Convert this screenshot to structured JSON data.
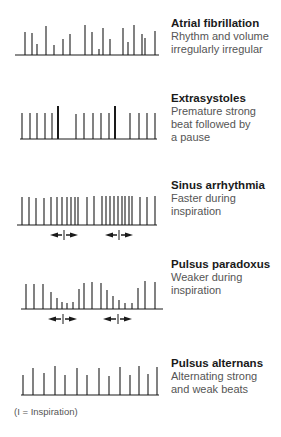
{
  "panels": [
    {
      "id": "atrial-fibrillation",
      "title": "Atrial fibrillation",
      "description": [
        "Rhythm and volume",
        "irregularly irregular"
      ],
      "baseline_y": 55,
      "trace_x": [
        15,
        159
      ],
      "beats": [
        {
          "x": 25,
          "top": 32
        },
        {
          "x": 32,
          "top": 33
        },
        {
          "x": 37,
          "top": 44
        },
        {
          "x": 46,
          "top": 26
        },
        {
          "x": 54,
          "top": 45
        },
        {
          "x": 63,
          "top": 39
        },
        {
          "x": 70,
          "top": 34
        },
        {
          "x": 85,
          "top": 25
        },
        {
          "x": 92,
          "top": 32
        },
        {
          "x": 99,
          "top": 49
        },
        {
          "x": 103,
          "top": 28
        },
        {
          "x": 110,
          "top": 39
        },
        {
          "x": 123,
          "top": 28
        },
        {
          "x": 128,
          "top": 42
        },
        {
          "x": 134,
          "top": 25
        },
        {
          "x": 142,
          "top": 34
        },
        {
          "x": 145,
          "top": 38
        },
        {
          "x": 155,
          "top": 31
        }
      ],
      "inspiration_markers": []
    },
    {
      "id": "extrasystoles",
      "title": "Extrasystoles",
      "description": [
        "Premature strong",
        "beat followed by",
        "a pause"
      ],
      "baseline_y": 139,
      "trace_x": [
        20,
        157
      ],
      "beats": [
        {
          "x": 22,
          "top": 113
        },
        {
          "x": 30,
          "top": 113
        },
        {
          "x": 37,
          "top": 113
        },
        {
          "x": 45,
          "top": 113
        },
        {
          "x": 52,
          "top": 113
        },
        {
          "x": 58,
          "top": 106,
          "strong": true
        },
        {
          "x": 76,
          "top": 114
        },
        {
          "x": 84,
          "top": 113
        },
        {
          "x": 93,
          "top": 113
        },
        {
          "x": 101,
          "top": 113
        },
        {
          "x": 109,
          "top": 113
        },
        {
          "x": 115,
          "top": 106,
          "strong": true
        },
        {
          "x": 130,
          "top": 113
        },
        {
          "x": 139,
          "top": 113
        },
        {
          "x": 147,
          "top": 113
        },
        {
          "x": 155,
          "top": 113
        }
      ],
      "inspiration_markers": []
    },
    {
      "id": "sinus-arrhythmia",
      "title": "Sinus arrhythmia",
      "description": [
        "Faster during",
        "inspiration"
      ],
      "baseline_y": 225,
      "trace_x": [
        17,
        157
      ],
      "beats": [
        {
          "x": 22,
          "top": 197
        },
        {
          "x": 29,
          "top": 197
        },
        {
          "x": 36,
          "top": 198
        },
        {
          "x": 44,
          "top": 198
        },
        {
          "x": 51,
          "top": 197
        },
        {
          "x": 57,
          "top": 197
        },
        {
          "x": 62,
          "top": 197
        },
        {
          "x": 67,
          "top": 197
        },
        {
          "x": 71,
          "top": 197
        },
        {
          "x": 75,
          "top": 197
        },
        {
          "x": 78,
          "top": 197
        },
        {
          "x": 87,
          "top": 197
        },
        {
          "x": 94,
          "top": 196
        },
        {
          "x": 102,
          "top": 196
        },
        {
          "x": 106,
          "top": 196
        },
        {
          "x": 110,
          "top": 196
        },
        {
          "x": 114,
          "top": 196
        },
        {
          "x": 118,
          "top": 196
        },
        {
          "x": 122,
          "top": 196
        },
        {
          "x": 125,
          "top": 196
        },
        {
          "x": 129,
          "top": 196
        },
        {
          "x": 132,
          "top": 196
        },
        {
          "x": 140,
          "top": 197
        },
        {
          "x": 147,
          "top": 197
        },
        {
          "x": 155,
          "top": 196
        }
      ],
      "inspiration_markers": [
        {
          "y": 235,
          "left": 50,
          "center": 64,
          "right": 78
        },
        {
          "y": 235,
          "left": 105,
          "center": 119,
          "right": 133
        }
      ]
    },
    {
      "id": "pulsus-paradoxus",
      "title": "Pulsus paradoxus",
      "description": [
        "Weaker during",
        "inspiration"
      ],
      "baseline_y": 309,
      "trace_x": [
        21,
        163
      ],
      "beats": [
        {
          "x": 26,
          "top": 284
        },
        {
          "x": 34,
          "top": 284
        },
        {
          "x": 43,
          "top": 284
        },
        {
          "x": 51,
          "top": 292
        },
        {
          "x": 57,
          "top": 298
        },
        {
          "x": 62,
          "top": 302
        },
        {
          "x": 67,
          "top": 303
        },
        {
          "x": 73,
          "top": 302
        },
        {
          "x": 79,
          "top": 289
        },
        {
          "x": 84,
          "top": 283
        },
        {
          "x": 92,
          "top": 282
        },
        {
          "x": 101,
          "top": 283
        },
        {
          "x": 107,
          "top": 290
        },
        {
          "x": 113,
          "top": 296
        },
        {
          "x": 119,
          "top": 300
        },
        {
          "x": 125,
          "top": 303
        },
        {
          "x": 132,
          "top": 303
        },
        {
          "x": 138,
          "top": 288
        },
        {
          "x": 145,
          "top": 281
        },
        {
          "x": 155,
          "top": 282
        }
      ],
      "inspiration_markers": [
        {
          "y": 319,
          "left": 48,
          "center": 63,
          "right": 77
        },
        {
          "y": 319,
          "left": 103,
          "center": 118,
          "right": 132
        }
      ]
    },
    {
      "id": "pulsus-alternans",
      "title": "Pulsus alternans",
      "description": [
        "Alternating strong",
        "and weak beats"
      ],
      "baseline_y": 395,
      "trace_x": [
        21,
        159
      ],
      "beats": [
        {
          "x": 23,
          "top": 375
        },
        {
          "x": 33,
          "top": 368
        },
        {
          "x": 44,
          "top": 373
        },
        {
          "x": 55,
          "top": 366
        },
        {
          "x": 65,
          "top": 375
        },
        {
          "x": 77,
          "top": 368
        },
        {
          "x": 87,
          "top": 375
        },
        {
          "x": 99,
          "top": 368
        },
        {
          "x": 109,
          "top": 376
        },
        {
          "x": 120,
          "top": 367
        },
        {
          "x": 130,
          "top": 375
        },
        {
          "x": 139,
          "top": 366
        },
        {
          "x": 148,
          "top": 374
        },
        {
          "x": 157,
          "top": 367
        }
      ],
      "inspiration_markers": []
    }
  ],
  "label_tops": [
    17,
    92,
    179,
    258,
    357
  ],
  "footnote": "(I = Inspiration)",
  "colors": {
    "ink": "#1a1a1a",
    "text_secondary": "#555555",
    "background": "#ffffff"
  }
}
